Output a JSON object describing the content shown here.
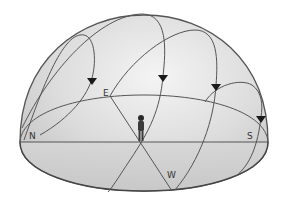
{
  "diagram": {
    "directions": {
      "north": "N",
      "east": "E",
      "south": "S",
      "west": "W"
    },
    "observer": "person-standing-at-center",
    "sun_paths": [
      {
        "name": "path-1",
        "arrow": "down"
      },
      {
        "name": "path-2",
        "arrow": "down"
      },
      {
        "name": "path-3",
        "arrow": "down"
      },
      {
        "name": "path-4",
        "arrow": "down"
      }
    ],
    "colors": {
      "dome_fill": "#d9d9d9",
      "dome_highlight": "#f2f2f2",
      "line": "#555555",
      "arrow": "#1a1a1a",
      "ground_fill": "#cfcfcf"
    }
  }
}
